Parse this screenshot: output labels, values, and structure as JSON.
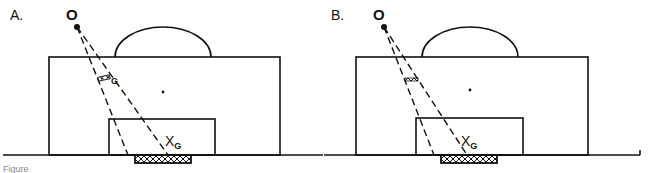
{
  "figure": {
    "caption_partial": "Figure",
    "panels": [
      {
        "id": "A",
        "label": "A.",
        "observer_label": "O",
        "target_label": "X",
        "target_subscript": "G",
        "marker_label": "G"
      },
      {
        "id": "B",
        "label": "B.",
        "observer_label": "O",
        "target_label": "X",
        "target_subscript": "G",
        "marker_label": ""
      }
    ]
  },
  "colors": {
    "line": "#111111",
    "background": "#ffffff"
  }
}
